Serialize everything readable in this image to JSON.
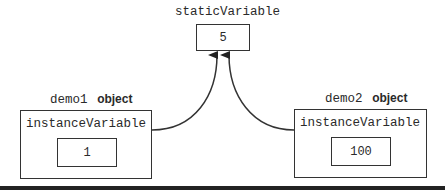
{
  "static": {
    "name": "staticVariable",
    "value": "5"
  },
  "objects": [
    {
      "name": "demo1",
      "suffix": "object",
      "field": "instanceVariable",
      "value": "1"
    },
    {
      "name": "demo2",
      "suffix": "object",
      "field": "instanceVariable",
      "value": "100"
    }
  ],
  "colors": {
    "stroke": "#333333",
    "background": "#ffffff"
  }
}
